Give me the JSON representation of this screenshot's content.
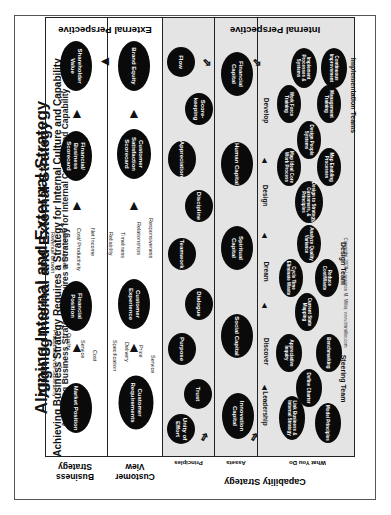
{
  "title": "Aligning Internal and External Strategy",
  "subtitle": "Achieving Business Strategy Requires a Strategy for Internal Culture and Capability",
  "perspectives": {
    "external": "External Perspective",
    "internal": "Internal Perspective"
  },
  "row_labels": {
    "business_strategy": "Business Strategy",
    "customer_view": "Customer View",
    "capability_strategy": "Capability Strategy",
    "principles": "Principles",
    "assets": "Assets",
    "what_you_do": "What You Do"
  },
  "business": {
    "nodes": [
      "Market Position",
      "Financial Position",
      "Financial/ Business Scorecard",
      "Shareholder Value"
    ],
    "market_drivers": [
      "Product/Service Superiority",
      "Quality",
      "Service",
      "Cost"
    ],
    "financial_drivers": [
      "Revenue Growth",
      "Return on Assets",
      "Cost/ Productivity",
      "Net Income"
    ]
  },
  "customer": {
    "nodes": [
      "Customer Requirements",
      "Customer Experience",
      "Customer Satisfaction Scorecard",
      "Brand Equity"
    ],
    "requirement_drivers": [
      "Specification",
      "Delivery",
      "Price",
      "Service"
    ],
    "experience_drivers": [
      "Reliability",
      "Timeliness",
      "Relationships",
      "Responsiveness"
    ]
  },
  "principles": [
    "Unity of Effort",
    "Trust",
    "Purpose",
    "Dialogue",
    "Teamwork",
    "Discipline",
    "Appreciation",
    "Score-keeping",
    "Flow"
  ],
  "assets": [
    "Innovation Capital",
    "Social Capital",
    "Spiritual Capital",
    "Human Capital",
    "Financial Capital"
  ],
  "stages": [
    "Leadership",
    "Discover",
    "Dream",
    "Design",
    "Develop"
  ],
  "what_you_do": {
    "steering": [
      "Link Business & Internal Strategy",
      "Model Principles",
      "Define Charter",
      "Appreciative Inquiry",
      "Benchmarking"
    ],
    "design": [
      "Current State Mapping",
      "Cycle Time Eliminate Waste",
      "Reduce Cost/Waste",
      "Analyze Quality Variance",
      "Design to Strategy, Customers, & Principles",
      "Map Ideal Core Work Process",
      "Map Enabling Processes",
      "Design People Systems"
    ],
    "implementation": [
      "Work Force Training",
      "Management Training",
      "Implement Processes & Systems",
      "Continuous Improvement"
    ]
  },
  "teams": [
    "Steering Team",
    "Design Team",
    "Implementation Teams"
  ],
  "copyright": "Copyright, 2008, Lawrence M. Miller, www.lmmiller.com"
}
